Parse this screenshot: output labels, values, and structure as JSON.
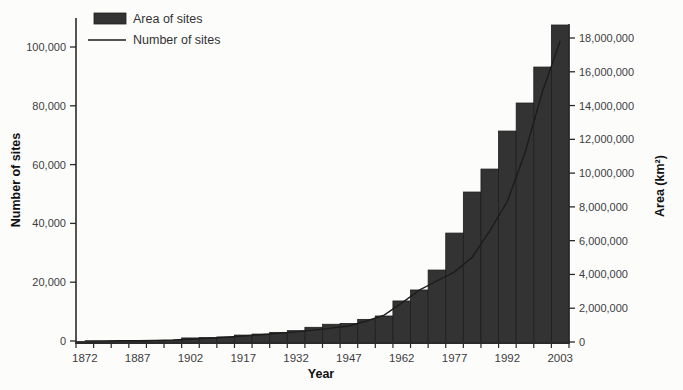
{
  "figure": {
    "legend": [
      {
        "label": "Area of sites",
        "swatch": "bar"
      },
      {
        "label": "Number of sites",
        "swatch": "line"
      }
    ],
    "xlabel": "Year",
    "left_axis_label": "Number of sites",
    "right_axis_label": "Area (km²)"
  },
  "chart_data": {
    "type": "bar",
    "subtype": "combo bar + line, dual y-axis",
    "title": "",
    "xlabel": "Year",
    "x": [
      "1872",
      "1877",
      "1882",
      "1887",
      "1892",
      "1897",
      "1902",
      "1907",
      "1912",
      "1917",
      "1922",
      "1927",
      "1932",
      "1937",
      "1942",
      "1947",
      "1952",
      "1957",
      "1962",
      "1967",
      "1972",
      "1977",
      "1982",
      "1987",
      "1992",
      "1997",
      "2002",
      "2003"
    ],
    "x_tick_labels": [
      "1872",
      "1887",
      "1902",
      "1917",
      "1932",
      "1947",
      "1962",
      "1977",
      "1992",
      "2003"
    ],
    "series": [
      {
        "name": "Area of sites",
        "type": "bar",
        "yaxis": "right",
        "units": "km²",
        "values": [
          30000,
          40000,
          50000,
          60000,
          80000,
          90000,
          240000,
          270000,
          300000,
          410000,
          470000,
          570000,
          670000,
          870000,
          1050000,
          1100000,
          1340000,
          1540000,
          2430000,
          3080000,
          4260000,
          6450000,
          8880000,
          10240000,
          12490000,
          14150000,
          16280000,
          18770000
        ]
      },
      {
        "name": "Number of sites",
        "type": "line",
        "yaxis": "left",
        "units": "sites",
        "values": [
          20,
          40,
          70,
          120,
          200,
          350,
          600,
          900,
          1300,
          1700,
          2100,
          2600,
          3100,
          3700,
          4400,
          5100,
          6800,
          8800,
          12900,
          17300,
          20400,
          23500,
          28500,
          37500,
          47500,
          64000,
          85000,
          102000
        ]
      }
    ],
    "left_axis": {
      "label": "Number of sites",
      "range": [
        0,
        100000
      ],
      "ticks": [
        0,
        20000,
        40000,
        60000,
        80000,
        100000
      ]
    },
    "right_axis": {
      "label": "Area (km²)",
      "range": [
        0,
        18000000
      ],
      "ticks": [
        0,
        2000000,
        4000000,
        6000000,
        8000000,
        10000000,
        12000000,
        14000000,
        16000000,
        18000000
      ]
    },
    "legend_position": "top-left",
    "grid": false,
    "colors": {
      "bar_fill": "#333333",
      "bar_edge": "#1e1e1e",
      "line": "#1c1c1c",
      "tick_text": "#3d3d3d",
      "axis": "#2a2a2a",
      "axis_title": "#111111"
    }
  }
}
